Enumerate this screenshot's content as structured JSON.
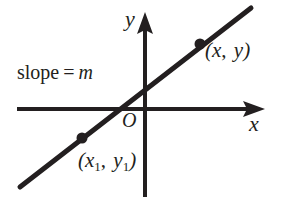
{
  "figure": {
    "background_color": "#ffffff",
    "ink_color": "#231f20"
  },
  "axes": {
    "x_label": "x",
    "y_label": "y",
    "origin_label": "O",
    "x_axis": {
      "start_x": 17,
      "end_x": 265,
      "y": 109
    },
    "y_axis": {
      "x": 145,
      "top_y": 12,
      "bottom_y": 197
    }
  },
  "annotations": {
    "slope_word": "slope",
    "equals_sign": "=",
    "slope_symbol": "m"
  },
  "points": [
    {
      "name": "upper-point",
      "label_open": "(",
      "var_x": "x",
      "var_x_sub": "",
      "separator": ",",
      "var_y": "y",
      "var_y_sub": "",
      "label_close": ")",
      "cx": 200,
      "cy": 44
    },
    {
      "name": "lower-point",
      "label_open": "(",
      "var_x": "x",
      "var_x_sub": "1",
      "separator": ",",
      "var_y": "y",
      "var_y_sub": "1",
      "label_close": ")",
      "cx": 82,
      "cy": 138
    }
  ],
  "line": {
    "x1": 20,
    "y1": 187,
    "x2": 251,
    "y2": 8,
    "stroke_width": 5
  }
}
